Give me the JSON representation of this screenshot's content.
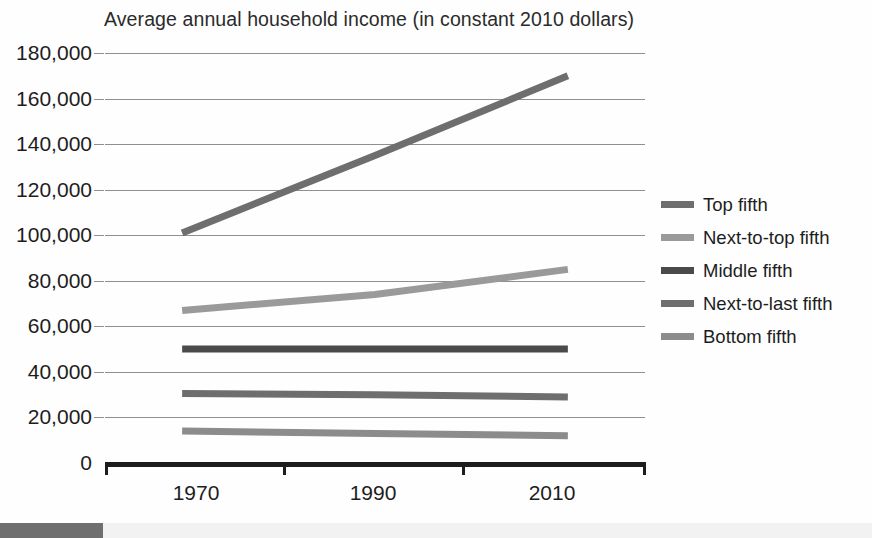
{
  "chart_data": {
    "type": "line",
    "title": "Average annual household income (in constant 2010 dollars)",
    "xlabel": "",
    "ylabel": "",
    "x": [
      1970,
      1990,
      2010
    ],
    "xlim": [
      1962,
      2018
    ],
    "ylim": [
      0,
      180000
    ],
    "grid": true,
    "legend_position": "right",
    "ytick_labels": [
      "180,000",
      "160,000",
      "140,000",
      "120,000",
      "100,000",
      "80,000",
      "60,000",
      "40,000",
      "20,000",
      "0"
    ],
    "ytick_values": [
      180000,
      160000,
      140000,
      120000,
      100000,
      80000,
      60000,
      40000,
      20000,
      0
    ],
    "xtick_labels": [
      "1970",
      "1990",
      "2010"
    ],
    "series": [
      {
        "name": "Top fifth",
        "color": "#6e6e6e",
        "values": [
          101000,
          135000,
          170000
        ]
      },
      {
        "name": "Next-to-top fifth",
        "color": "#9a9a9a",
        "values": [
          67000,
          74000,
          85000
        ]
      },
      {
        "name": "Middle fifth",
        "color": "#4a4a4a",
        "values": [
          50000,
          50000,
          50000
        ]
      },
      {
        "name": "Next-to-last fifth",
        "color": "#6e6e6e",
        "values": [
          30500,
          30000,
          29000
        ]
      },
      {
        "name": "Bottom fifth",
        "color": "#8c8c8c",
        "values": [
          14000,
          13000,
          12000
        ]
      }
    ]
  },
  "axis": {
    "axis_color": "#1d1d1d",
    "grid_color": "#8f8f8f"
  }
}
